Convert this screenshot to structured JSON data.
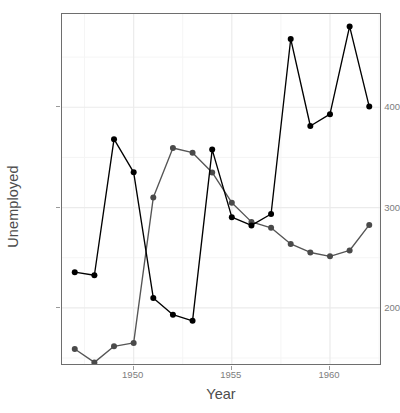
{
  "chart_data": {
    "type": "line",
    "title": "",
    "subtitle": "",
    "xlabel": "Year",
    "ylabel": "Unemployed",
    "xlim": [
      1946.35,
      1962.65
    ],
    "ylim": [
      142.0,
      493.0
    ],
    "xticks": [
      1950,
      1955,
      1960
    ],
    "xtick_labels": [
      "1950",
      "1955",
      "1960"
    ],
    "yticks": [
      200,
      300,
      400
    ],
    "ytick_labels": [
      "200",
      "300",
      "400"
    ],
    "grid": {
      "major_color": "#ebebeb",
      "minor_color": "#f5f5f5",
      "x_major": [
        1950,
        1955,
        1960
      ],
      "x_minor": [
        1947.5,
        1952.5,
        1957.5,
        1962.5
      ],
      "y_major": [
        200,
        300,
        400
      ],
      "y_minor": [
        150,
        250,
        350,
        450
      ]
    },
    "legend": {
      "position": "none",
      "entries": []
    },
    "x": [
      1947,
      1948,
      1949,
      1950,
      1951,
      1952,
      1953,
      1954,
      1955,
      1956,
      1957,
      1958,
      1959,
      1960,
      1961,
      1962
    ],
    "series": [
      {
        "name": "Unemployed",
        "color": "#000000",
        "point_color": "#000000",
        "values": [
          235.6,
          232.5,
          368.2,
          335.1,
          209.9,
          193.2,
          187.0,
          357.8,
          290.4,
          282.2,
          293.6,
          468.1,
          381.3,
          393.1,
          480.6,
          400.7
        ]
      },
      {
        "name": "Armed.Forces",
        "color": "#555555",
        "point_color": "#4a4a4a",
        "values": [
          159.0,
          145.6,
          161.6,
          165.0,
          309.9,
          359.4,
          354.7,
          335.0,
          304.8,
          285.7,
          279.8,
          263.7,
          255.2,
          251.4,
          257.2,
          282.7
        ]
      }
    ],
    "annotations": []
  },
  "axes": {
    "y_title": "Unemployed",
    "x_title": "Year"
  },
  "theme": {
    "panel_background": "#ffffff",
    "panel_border": "#6e6e6e",
    "grid_major": "#ebebeb",
    "grid_minor": "#f5f5f5",
    "tick_text": "#7d7d7d",
    "axis_title": "#4d4d4d",
    "page_background": "#ffffff"
  }
}
